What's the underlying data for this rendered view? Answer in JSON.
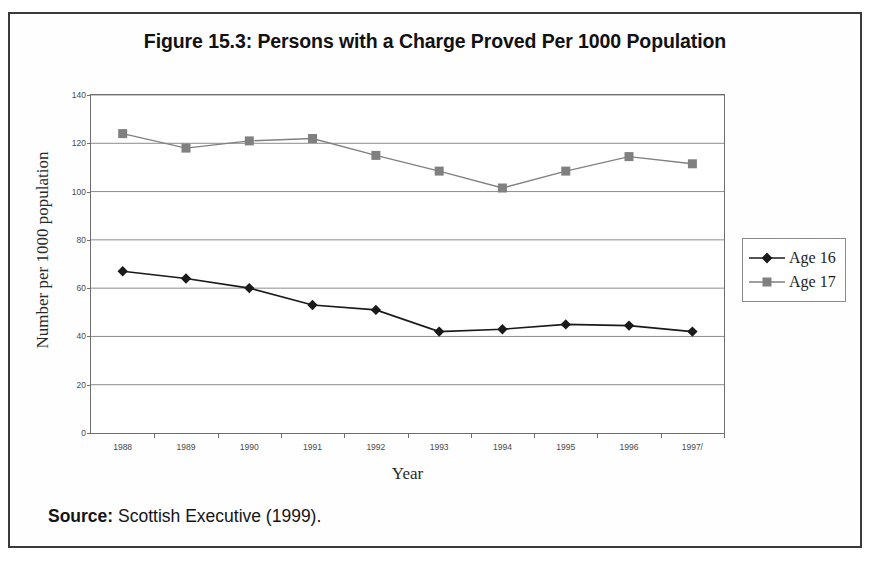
{
  "figure": {
    "title": "Figure 15.3: Persons with a Charge Proved Per 1000 Population",
    "source_label": "Source:",
    "source_text": " Scottish Executive (1999)."
  },
  "chart_data": {
    "type": "line",
    "title": "Figure 15.3: Persons with a Charge Proved Per 1000 Population",
    "xlabel": "Year",
    "ylabel": "Number per 1000 population",
    "categories": [
      "1988",
      "1989",
      "1990",
      "1991",
      "1992",
      "1993",
      "1994",
      "1995",
      "1996",
      "1997/"
    ],
    "series": [
      {
        "name": "Age 16",
        "color": "#1a1a1a",
        "marker": "diamond",
        "values": [
          67,
          64,
          60,
          53,
          51,
          42,
          43,
          45,
          44.5,
          42
        ]
      },
      {
        "name": "Age 17",
        "color": "#808080",
        "marker": "square",
        "values": [
          124,
          118,
          121,
          122,
          115,
          108.5,
          101.5,
          108.5,
          114.5,
          111.5
        ]
      }
    ],
    "ylim": [
      0,
      140
    ],
    "yticks": [
      0,
      20,
      40,
      60,
      80,
      100,
      120,
      140
    ],
    "grid": true,
    "legend_position": "right"
  }
}
